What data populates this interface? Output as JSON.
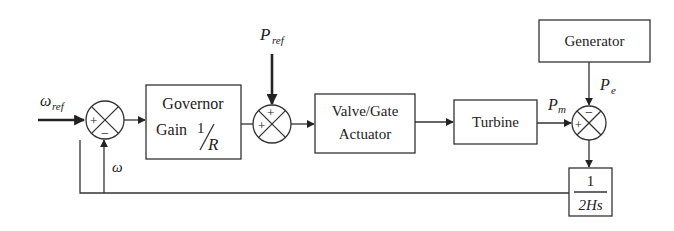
{
  "diagram": {
    "title": "",
    "inputs": {
      "omega_ref": {
        "symbol": "ω",
        "subscript": "ref"
      },
      "p_ref": {
        "symbol": "P",
        "subscript": "ref"
      }
    },
    "blocks": {
      "governor": {
        "line1": "Governor",
        "line2": "Gain",
        "gain_num": "1",
        "gain_den": "R"
      },
      "valve": {
        "line1": "Valve/Gate",
        "line2": "Actuator"
      },
      "turbine": {
        "label": "Turbine"
      },
      "generator": {
        "label": "Generator"
      },
      "inertia": {
        "num": "1",
        "den": "2Hs"
      }
    },
    "junctions": {
      "sum1": {
        "left_sign": "+",
        "bottom_sign": "−"
      },
      "sum2": {
        "left_sign": "+",
        "top_sign": "+"
      },
      "sum3": {
        "left_sign": "+",
        "top_sign": "−"
      }
    },
    "signals": {
      "pm": {
        "symbol": "P",
        "subscript": "m"
      },
      "pe": {
        "symbol": "P",
        "subscript": "e"
      },
      "omega": {
        "symbol": "ω"
      }
    }
  }
}
